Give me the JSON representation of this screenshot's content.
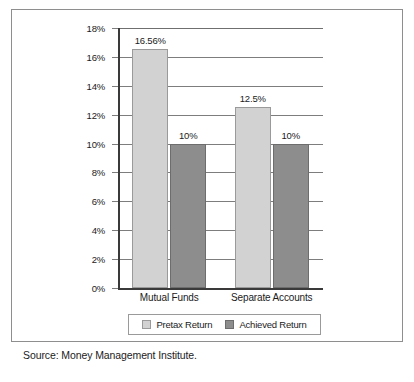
{
  "chart_data": {
    "type": "bar",
    "title": "",
    "xlabel": "",
    "ylabel": "",
    "categories": [
      "Mutual Funds",
      "Separate Accounts"
    ],
    "series": [
      {
        "name": "Pretax Return",
        "color": "#d2d2d2",
        "values": [
          16.56,
          12.5
        ],
        "value_labels": [
          "16.56%",
          "12.5%"
        ]
      },
      {
        "name": "Achieved Return",
        "color": "#8d8d8d",
        "values": [
          10,
          10
        ],
        "value_labels": [
          "10%",
          "10%"
        ]
      }
    ],
    "ylim": [
      0,
      18
    ],
    "ytick_values": [
      18,
      16,
      14,
      12,
      10,
      8,
      6,
      4,
      2,
      0
    ],
    "ytick_labels": [
      "18%",
      "16%",
      "14%",
      "12%",
      "10%",
      "8%",
      "6%",
      "4%",
      "2%",
      "0%"
    ],
    "grid": true,
    "legend_position": "bottom"
  },
  "legend": {
    "items": [
      {
        "label": "Pretax Return",
        "swatch": "light-gray-swatch"
      },
      {
        "label": "Achieved Return",
        "swatch": "dark-gray-swatch"
      }
    ]
  },
  "source": {
    "text": "Source: Money Management Institute."
  }
}
